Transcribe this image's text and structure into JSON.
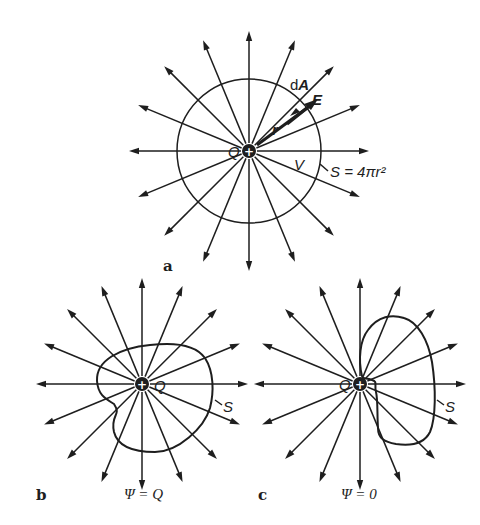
{
  "figure": {
    "panels": [
      {
        "id": "a",
        "label": "a",
        "charge_label": "Q",
        "charge_sign": "+",
        "field_line_count": 16,
        "surface_shape": "sphere",
        "labels": {
          "area_element": "dA",
          "field": "E",
          "radius": "r",
          "volume": "V",
          "surface": "S = 4πr²"
        }
      },
      {
        "id": "b",
        "label": "b",
        "charge_label": "Q",
        "charge_sign": "+",
        "field_line_count": 16,
        "surface_shape": "irregular closed surface enclosing charge",
        "surface_label": "S",
        "flux_caption": "Ψ = Q"
      },
      {
        "id": "c",
        "label": "c",
        "charge_label": "Q",
        "charge_sign": "+",
        "field_line_count": 16,
        "surface_shape": "irregular closed surface not enclosing charge",
        "surface_label": "S",
        "flux_caption": "Ψ = 0"
      }
    ],
    "colors": {
      "ink": "#1e1e1e",
      "background": "#ffffff"
    }
  }
}
